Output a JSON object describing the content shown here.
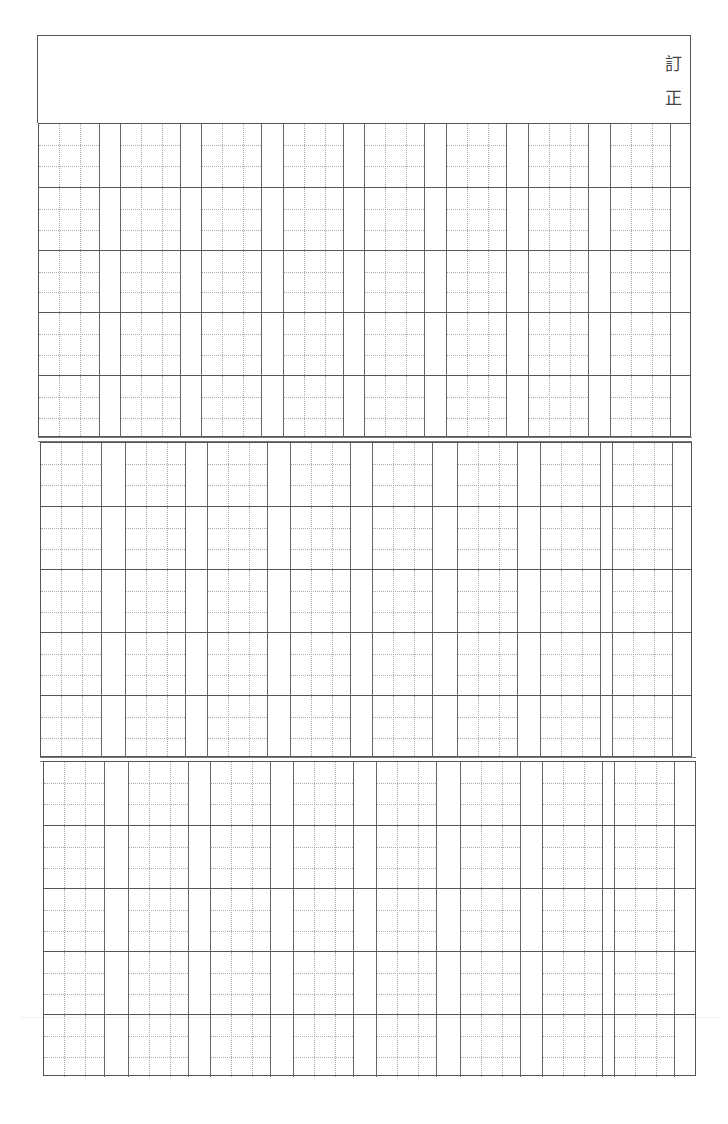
{
  "document": {
    "type": "correction-manuscript-sheet",
    "header": {
      "label_chars": [
        "訂",
        "正"
      ]
    },
    "grid": {
      "sections": [
        {
          "name": "section-1",
          "left": 38,
          "top": 123,
          "right": 691,
          "bottom": 437,
          "rows": 5,
          "row_tops": [
            123,
            185,
            248,
            311,
            374
          ],
          "cols": 8,
          "col_cell_starts": [
            38,
            119,
            200,
            282,
            363,
            445,
            527,
            609
          ],
          "cell_width": 61
        },
        {
          "name": "section-2",
          "left": 40,
          "top": 442,
          "right": 692,
          "bottom": 757,
          "rows": 5,
          "row_tops": [
            442,
            505,
            568,
            631,
            694
          ],
          "cols": 8,
          "col_cell_starts": [
            40,
            124,
            206,
            289,
            371,
            456,
            539,
            611
          ],
          "cell_width": 61
        },
        {
          "name": "section-3",
          "left": 43,
          "top": 761,
          "right": 696,
          "bottom": 1076,
          "rows": 5,
          "row_tops": [
            761,
            823,
            887,
            949,
            1012
          ],
          "cols": 8,
          "col_cell_starts": [
            43,
            127,
            209,
            292,
            375,
            459,
            541,
            613
          ],
          "cell_width": 61
        }
      ],
      "cell_guides": "3x3 dotted"
    },
    "colors": {
      "line": "#555555",
      "guide": "#aaaaaa",
      "text": "#444444",
      "paper": "#ffffff"
    }
  }
}
